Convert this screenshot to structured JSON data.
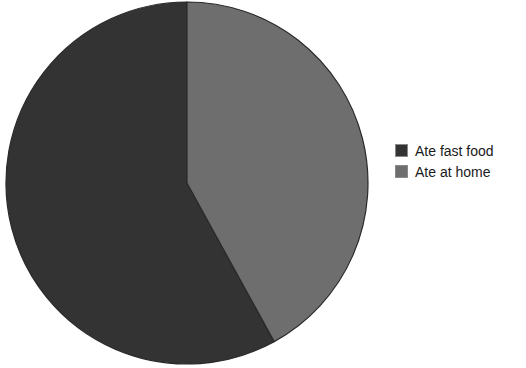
{
  "chart_data": {
    "type": "pie",
    "title": "",
    "categories": [
      "Ate fast food",
      "Ate at home"
    ],
    "values": [
      58,
      42
    ],
    "units": "percent",
    "colors": [
      "#333333",
      "#6e6e6e"
    ],
    "legend_position": "right",
    "start_angle_deg": 0,
    "direction": "counterclockwise",
    "outline_color": "#2a2a2a",
    "background": "#ffffff",
    "xlabel": "",
    "ylabel": ""
  },
  "title": {
    "text": ""
  },
  "pie": {
    "center_x": 187,
    "center_y": 183,
    "radius": 181,
    "slices": [
      {
        "label": "Ate fast food",
        "value": 58,
        "color": "#333333"
      },
      {
        "label": "Ate at home",
        "value": 42,
        "color": "#6e6e6e"
      }
    ]
  },
  "legend": {
    "items": [
      {
        "label": "Ate fast food",
        "color": "#333333"
      },
      {
        "label": "Ate at home",
        "color": "#6e6e6e"
      }
    ]
  }
}
